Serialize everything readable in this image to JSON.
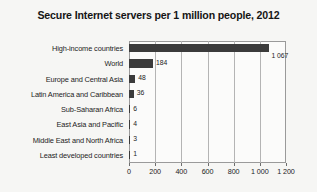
{
  "chart_data": {
    "type": "bar",
    "orientation": "horizontal",
    "title": "Secure Internet servers per 1 million people, 2012",
    "xlabel": "",
    "ylabel": "",
    "xlim": [
      0,
      1200
    ],
    "grid": true,
    "legend": "none",
    "categories": [
      "High-income countries",
      "World",
      "Europe and Central Asia",
      "Latin America and Caribbean",
      "Sub-Saharan Africa",
      "East Asia and Pacific",
      "Middle East and North Africa",
      "Least developed countries"
    ],
    "values": [
      1067,
      184,
      48,
      36,
      6,
      4,
      3,
      1
    ],
    "value_labels": [
      "1 067",
      "184",
      "48",
      "36",
      "6",
      "4",
      "3",
      "1"
    ],
    "xticks": [
      0,
      200,
      400,
      600,
      800,
      1000,
      1200
    ],
    "xtick_labels": [
      "0",
      "200",
      "400",
      "600",
      "800",
      "1 000",
      "1 200"
    ],
    "bar_color": "#3b3b3b",
    "plot_background": "#fbfbfa",
    "page_background": "#f6f6f4",
    "gridline_color": "#b4b4b4",
    "axis_color": "#9a9a9a"
  }
}
